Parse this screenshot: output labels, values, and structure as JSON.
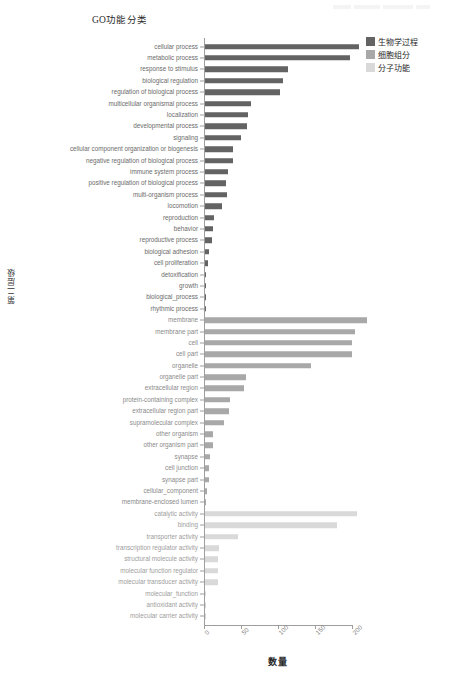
{
  "watermark": {
    "text": ""
  },
  "chart_data": {
    "type": "bar",
    "orientation": "horizontal",
    "title": "GO功能分类",
    "xlabel": "数量",
    "ylabel": "第二层级",
    "xlim": [
      0,
      225
    ],
    "xticks": [
      0,
      50,
      100,
      150,
      200
    ],
    "xticklabels": [
      "0",
      "50",
      "100",
      "150",
      "200"
    ],
    "grid": false,
    "legend_position": "top-right",
    "colors": {
      "biological_process": "#636363",
      "cellular_component": "#a8a8a8",
      "molecular_function": "#d9d9d9",
      "axis": "#9e9e9e",
      "label": "#6b6b6b"
    },
    "legend": [
      {
        "label": "生物学过程",
        "color": "#636363",
        "key": "biological_process"
      },
      {
        "label": "细胞组分",
        "color": "#a8a8a8",
        "key": "cellular_component"
      },
      {
        "label": "分子功能",
        "color": "#d9d9d9",
        "key": "molecular_function"
      }
    ],
    "series": [
      {
        "name": "生物学过程",
        "key": "biological_process",
        "color": "#636363",
        "items": [
          {
            "category": "cellular process",
            "value": 208
          },
          {
            "category": "metabolic process",
            "value": 196
          },
          {
            "category": "response to stimulus",
            "value": 112
          },
          {
            "category": "biological regulation",
            "value": 105
          },
          {
            "category": "regulation of biological process",
            "value": 102
          },
          {
            "category": "multicellular organismal process",
            "value": 62
          },
          {
            "category": "localization",
            "value": 58
          },
          {
            "category": "developmental process",
            "value": 57
          },
          {
            "category": "signaling",
            "value": 49
          },
          {
            "category": "cellular component organization or biogenesis",
            "value": 38
          },
          {
            "category": "negative regulation of biological process",
            "value": 38
          },
          {
            "category": "immune system process",
            "value": 31
          },
          {
            "category": "positive regulation of biological process",
            "value": 29
          },
          {
            "category": "multi-organism process",
            "value": 30
          },
          {
            "category": "locomotion",
            "value": 23
          },
          {
            "category": "reproduction",
            "value": 12
          },
          {
            "category": "behavior",
            "value": 11
          },
          {
            "category": "reproductive process",
            "value": 9
          },
          {
            "category": "biological adhesion",
            "value": 5
          },
          {
            "category": "cell proliferation",
            "value": 4
          },
          {
            "category": "detoxification",
            "value": 2
          },
          {
            "category": "growth",
            "value": 1
          },
          {
            "category": "biological_process",
            "value": 1
          },
          {
            "category": "rhythmic process",
            "value": 1
          }
        ]
      },
      {
        "name": "细胞组分",
        "key": "cellular_component",
        "color": "#a8a8a8",
        "items": [
          {
            "category": "membrane",
            "value": 219
          },
          {
            "category": "membrane part",
            "value": 203
          },
          {
            "category": "cell",
            "value": 198
          },
          {
            "category": "cell part",
            "value": 198
          },
          {
            "category": "organelle",
            "value": 143
          },
          {
            "category": "organelle part",
            "value": 56
          },
          {
            "category": "extracellular region",
            "value": 53
          },
          {
            "category": "protein-containing complex",
            "value": 34
          },
          {
            "category": "extracellular region part",
            "value": 33
          },
          {
            "category": "supramolecular complex",
            "value": 25
          },
          {
            "category": "other organism",
            "value": 11
          },
          {
            "category": "other organism part",
            "value": 11
          },
          {
            "category": "synapse",
            "value": 7
          },
          {
            "category": "cell junction",
            "value": 5
          },
          {
            "category": "synapse part",
            "value": 5
          },
          {
            "category": "cellular_component",
            "value": 3
          },
          {
            "category": "membrane-enclosed lumen",
            "value": 2
          }
        ]
      },
      {
        "name": "分子功能",
        "key": "molecular_function",
        "color": "#d9d9d9",
        "items": [
          {
            "category": "catalytic activity",
            "value": 205
          },
          {
            "category": "binding",
            "value": 178
          },
          {
            "category": "transporter activity",
            "value": 44
          },
          {
            "category": "transcription regulator activity",
            "value": 19
          },
          {
            "category": "structural molecule activity",
            "value": 18
          },
          {
            "category": "molecular function regulator",
            "value": 18
          },
          {
            "category": "molecular transducer activity",
            "value": 17
          },
          {
            "category": "molecular_function",
            "value": 2
          },
          {
            "category": "antioxidant activity",
            "value": 1
          },
          {
            "category": "molecular carrier activity",
            "value": 1
          }
        ]
      }
    ]
  }
}
